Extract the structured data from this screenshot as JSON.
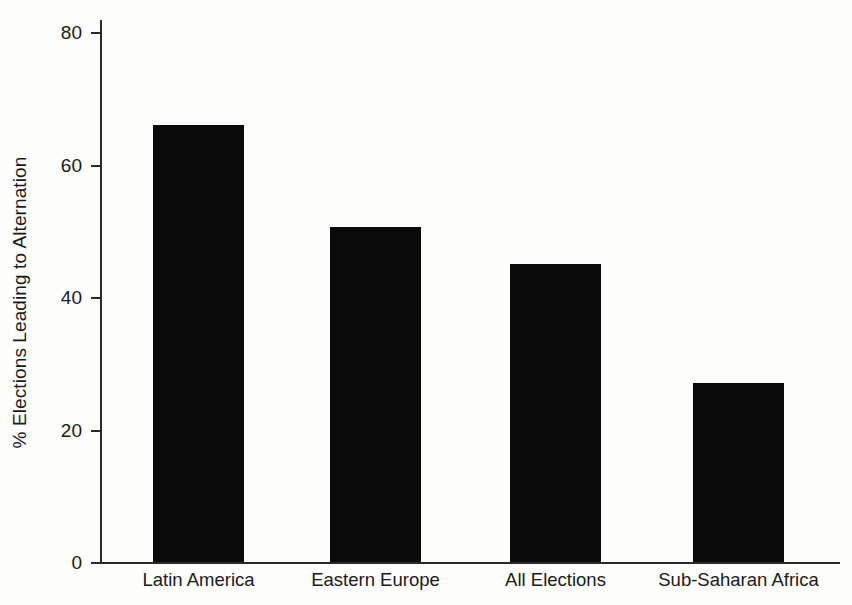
{
  "chart_data": {
    "type": "bar",
    "title": "",
    "subtitle": "",
    "xlabel": "",
    "ylabel": "% Elections Leading to Alternation",
    "categories": [
      "Latin America",
      "Eastern Europe",
      "All Elections",
      "Sub-Saharan Africa"
    ],
    "values": [
      66,
      50.5,
      45,
      27
    ],
    "ylim": [
      0,
      80
    ],
    "yticks": [
      0,
      20,
      40,
      60,
      80
    ],
    "ytick_labels": [
      "0",
      "20",
      "40",
      "60",
      "80"
    ],
    "grid": false,
    "legend": false,
    "legend_position": "none",
    "bar_color": "#0a0a0a",
    "axis_color": "#2a2a2a",
    "background_color": "#fdfdfc",
    "series": [
      {
        "name": "% Elections Leading to Alternation",
        "values": [
          66,
          50.5,
          45,
          27
        ]
      }
    ]
  },
  "axes": {
    "y_title": "% Elections Leading to Alternation",
    "tick_0": "0",
    "tick_20": "20",
    "tick_40": "40",
    "tick_60": "60",
    "tick_80": "80"
  },
  "bars": [
    {
      "label": "Latin America",
      "value": 66
    },
    {
      "label": "Eastern Europe",
      "value": 50.5
    },
    {
      "label": "All Elections",
      "value": 45
    },
    {
      "label": "Sub-Saharan Africa",
      "value": 27
    }
  ]
}
